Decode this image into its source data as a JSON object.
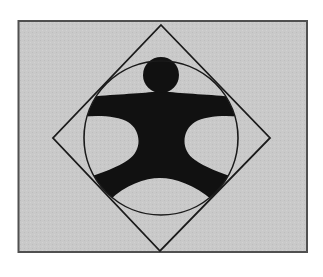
{
  "figure": {
    "description": "Human figure with outstretched arms and legs inscribed in a circle, which is inscribed in a square rotated 45 degrees (diamond), on a gray rectangular background",
    "colors": {
      "background_panel": "#c8c8c8",
      "panel_border": "#505050",
      "stroke": "#1a1a1a",
      "figure_fill": "#111111",
      "page": "#ffffff"
    },
    "shapes": {
      "panel": {
        "x": 18,
        "y": 21,
        "width": 289,
        "height": 231
      },
      "diamond": {
        "top": [
          161,
          25
        ],
        "right": [
          270,
          138
        ],
        "bottom": [
          160,
          251
        ],
        "left": [
          53,
          138
        ]
      },
      "circle": {
        "cx": 161,
        "cy": 138,
        "r": 77
      },
      "head": {
        "cx": 161,
        "cy": 75,
        "r": 18
      }
    }
  }
}
